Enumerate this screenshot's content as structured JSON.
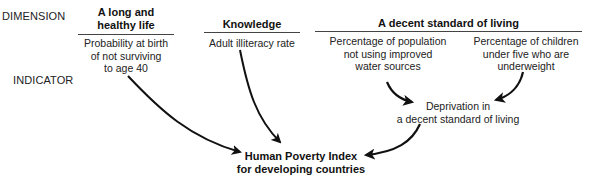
{
  "row_labels": {
    "dimension": "DIMENSION",
    "indicator": "INDICATOR"
  },
  "dimensions": [
    {
      "label_line1": "A long and",
      "label_line2": "healthy life"
    },
    {
      "label": "Knowledge"
    },
    {
      "label": "A decent standard of living"
    }
  ],
  "indicators": [
    {
      "line1": "Probability at birth",
      "line2": "of not surviving",
      "line3": "to age 40"
    },
    {
      "line1": "Adult illiteracy rate"
    },
    {
      "line1": "Percentage of population",
      "line2": "not using improved",
      "line3": "water sources"
    },
    {
      "line1": "Percentage of children",
      "line2": "under five who are",
      "line3": "underweight"
    }
  ],
  "intermediate": {
    "line1": "Deprivation in",
    "line2": "a decent standard of living"
  },
  "result": {
    "line1": "Human Poverty Index",
    "line2": "for developing countries"
  },
  "colors": {
    "arrow": "#111111",
    "rule": "#444444",
    "background": "#ffffff"
  }
}
